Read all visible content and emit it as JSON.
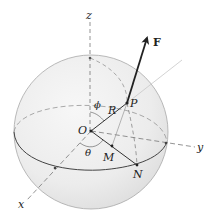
{
  "diagram": {
    "type": "spherical-coordinates",
    "labels": {
      "z_axis": "z",
      "x_axis": "x",
      "y_axis": "y",
      "origin": "O",
      "point_p": "P",
      "point_m": "M",
      "point_n": "N",
      "radius": "R",
      "polar_angle": "ϕ",
      "azimuth_angle": "θ",
      "force": "F"
    },
    "colors": {
      "sphere_fill": "#ebebeb",
      "sphere_outline": "#9a9a9a",
      "equator": "#444444",
      "axis_dashed": "#666666",
      "vector": "#222222",
      "guide_line": "#c8c8c8"
    }
  }
}
